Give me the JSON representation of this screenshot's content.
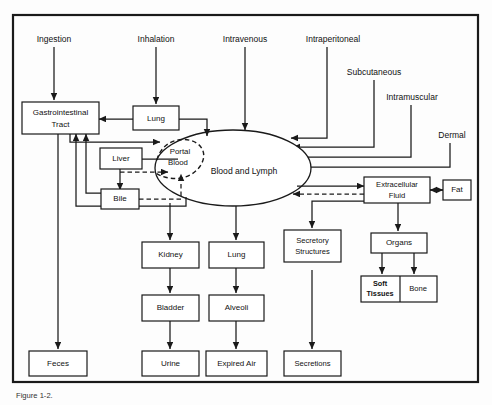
{
  "figure": {
    "caption": "Figure 1-2.",
    "frame_color": "#1a1a1a",
    "background_color": "#fdfdfd"
  },
  "routes": [
    {
      "id": "ingestion",
      "label": "Ingestion"
    },
    {
      "id": "inhalation",
      "label": "Inhalation"
    },
    {
      "id": "intravenous",
      "label": "Intravenous"
    },
    {
      "id": "intraperitoneal",
      "label": "Intraperitoneal"
    },
    {
      "id": "subcutaneous",
      "label": "Subcutaneous"
    },
    {
      "id": "intramuscular",
      "label": "Intramuscular"
    },
    {
      "id": "dermal",
      "label": "Dermal"
    }
  ],
  "central": {
    "main_label": "Blood and Lymph",
    "sub_label_line1": "Portal",
    "sub_label_line2": "Blood"
  },
  "nodes": [
    {
      "id": "gi-tract",
      "label_line1": "Gastrointestinal",
      "label_line2": "Tract"
    },
    {
      "id": "lung-top",
      "label_line1": "Lung",
      "label_line2": ""
    },
    {
      "id": "liver",
      "label_line1": "Liver",
      "label_line2": ""
    },
    {
      "id": "bile",
      "label_line1": "Bile",
      "label_line2": ""
    },
    {
      "id": "feces",
      "label_line1": "Feces",
      "label_line2": ""
    },
    {
      "id": "kidney",
      "label_line1": "Kidney",
      "label_line2": ""
    },
    {
      "id": "bladder",
      "label_line1": "Bladder",
      "label_line2": ""
    },
    {
      "id": "urine",
      "label_line1": "Urine",
      "label_line2": ""
    },
    {
      "id": "lung-bottom",
      "label_line1": "Lung",
      "label_line2": ""
    },
    {
      "id": "alveoli",
      "label_line1": "Alveoli",
      "label_line2": ""
    },
    {
      "id": "expired-air",
      "label_line1": "Expired Air",
      "label_line2": ""
    },
    {
      "id": "secretory-structures",
      "label_line1": "Secretory",
      "label_line2": "Structures"
    },
    {
      "id": "secretions",
      "label_line1": "Secretions",
      "label_line2": ""
    },
    {
      "id": "extracellular-fluid",
      "label_line1": "Extracellular",
      "label_line2": "Fluid"
    },
    {
      "id": "fat",
      "label_line1": "Fat",
      "label_line2": ""
    },
    {
      "id": "organs",
      "label_line1": "Organs",
      "label_line2": ""
    },
    {
      "id": "soft-tissues",
      "label_line1": "Soft",
      "label_line2": "Tissues"
    },
    {
      "id": "bone",
      "label_line1": "Bone",
      "label_line2": ""
    }
  ]
}
